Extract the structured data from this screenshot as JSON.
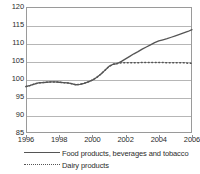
{
  "chart_data": {
    "type": "line",
    "title": "",
    "subtitle": "",
    "xlabel": "",
    "ylabel": "",
    "xlim": [
      1996,
      2006
    ],
    "ylim": [
      85,
      120
    ],
    "yticks": [
      85,
      90,
      95,
      100,
      105,
      110,
      115,
      120
    ],
    "xticks": [
      1996,
      1998,
      2000,
      2002,
      2004,
      2006
    ],
    "xtick_labels": [
      "1996",
      "1998",
      "2000",
      "2002",
      "2004",
      "2006"
    ],
    "ytick_labels": [
      "85",
      "90",
      "95",
      "100",
      "105",
      "110",
      "115",
      "120"
    ],
    "grid": true,
    "grid_axis": "y",
    "legend_position": "below",
    "x": [
      1996.0,
      1996.25,
      1996.5,
      1996.75,
      1997.0,
      1997.25,
      1997.5,
      1997.75,
      1998.0,
      1998.25,
      1998.5,
      1998.75,
      1999.0,
      1999.25,
      1999.5,
      1999.75,
      2000.0,
      2000.25,
      2000.5,
      2000.75,
      2001.0,
      2001.25,
      2001.5,
      2001.75,
      2002.0,
      2002.25,
      2002.5,
      2002.75,
      2003.0,
      2003.25,
      2003.5,
      2003.75,
      2004.0,
      2004.25,
      2004.5,
      2004.75,
      2005.0,
      2005.25,
      2005.5,
      2005.75,
      2006.0
    ],
    "series": [
      {
        "name": "Food products, beverages and tobacco",
        "style": "solid",
        "color": "#555555",
        "values": [
          97.9,
          98.2,
          98.6,
          98.9,
          99.0,
          99.1,
          99.2,
          99.2,
          99.1,
          99.0,
          98.9,
          98.7,
          98.4,
          98.5,
          98.8,
          99.2,
          99.7,
          100.4,
          101.3,
          102.4,
          103.5,
          104.1,
          104.3,
          104.9,
          105.6,
          106.3,
          107.0,
          107.6,
          108.3,
          108.9,
          109.5,
          110.1,
          110.6,
          110.9,
          111.2,
          111.6,
          112.0,
          112.4,
          112.8,
          113.2,
          113.7
        ]
      },
      {
        "name": "Dairy products",
        "style": "dotted",
        "color": "#555555",
        "values": [
          97.9,
          98.2,
          98.6,
          98.9,
          99.0,
          99.1,
          99.2,
          99.2,
          99.1,
          99.0,
          98.9,
          98.7,
          98.4,
          98.5,
          98.8,
          99.2,
          99.7,
          100.4,
          101.3,
          102.4,
          103.5,
          104.1,
          104.3,
          104.5,
          104.5,
          104.5,
          104.5,
          104.5,
          104.6,
          104.6,
          104.6,
          104.6,
          104.6,
          104.6,
          104.5,
          104.5,
          104.5,
          104.5,
          104.5,
          104.4,
          104.4
        ]
      }
    ],
    "legend": [
      {
        "label": "Food products, beverages and tobacco",
        "style": "solid"
      },
      {
        "label": "Dairy products",
        "style": "dotted"
      }
    ]
  }
}
